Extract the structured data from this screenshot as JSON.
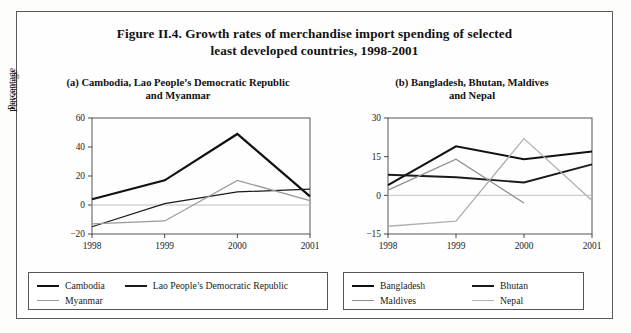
{
  "figure": {
    "title_line1": "Figure II.4.  Growth rates of merchandise import spending of selected",
    "title_line2": "least developed countries, 1998-2001"
  },
  "panel_a": {
    "subtitle_line1": "(a)   Cambodia, Lao People’s Democratic Republic",
    "subtitle_line2": "and Myanmar",
    "legend": [
      {
        "label": "Cambodia",
        "color": "#111111"
      },
      {
        "label": "Lao People’s Democratic Republic",
        "color": "#1a1a1a"
      },
      {
        "label": "Myanmar",
        "color": "#9a9a9a"
      }
    ]
  },
  "panel_b": {
    "subtitle_line1": "(b)   Bangladesh, Bhutan, Maldives",
    "subtitle_line2": "and Nepal",
    "legend": [
      {
        "label": "Bangladesh",
        "color": "#111111"
      },
      {
        "label": "Bhutan",
        "color": "#1a1a1a"
      },
      {
        "label": "Maldives",
        "color": "#8e8e8e"
      },
      {
        "label": "Nepal",
        "color": "#b0b0b0"
      }
    ]
  },
  "chart_data": [
    {
      "id": "chart-a",
      "type": "line",
      "title": "(a)   Cambodia, Lao People’s Democratic Republic and Myanmar",
      "xlabel": "",
      "ylabel": "Percentage",
      "categories": [
        "1998",
        "1999",
        "2000",
        "2001"
      ],
      "x": [
        1998,
        1999,
        2000,
        2001
      ],
      "ylim": [
        -20,
        60
      ],
      "yticks": [
        -20,
        0,
        20,
        40,
        60
      ],
      "ytick_labels": [
        "−20",
        "0",
        "20",
        "40",
        "60"
      ],
      "grid": false,
      "legend_position": "bottom",
      "series": [
        {
          "name": "Cambodia",
          "color": "#111111",
          "width": 2.2,
          "values": [
            4,
            17,
            49,
            6
          ]
        },
        {
          "name": "Lao People’s Democratic Republic",
          "color": "#1a1a1a",
          "width": 1.3,
          "values": [
            -15,
            1,
            9,
            11
          ]
        },
        {
          "name": "Myanmar",
          "color": "#9a9a9a",
          "width": 1.3,
          "values": [
            -13,
            -11,
            17,
            3
          ]
        }
      ]
    },
    {
      "id": "chart-b",
      "type": "line",
      "title": "(b)   Bangladesh, Bhutan, Maldives and Nepal",
      "xlabel": "",
      "ylabel": "Percentage",
      "categories": [
        "1998",
        "1999",
        "2000",
        "2001"
      ],
      "x": [
        1998,
        1999,
        2000,
        2001
      ],
      "ylim": [
        -15,
        30
      ],
      "yticks": [
        -15,
        0,
        15,
        30
      ],
      "ytick_labels": [
        "−15",
        "0",
        "15",
        "30"
      ],
      "grid": false,
      "legend_position": "bottom",
      "series": [
        {
          "name": "Bangladesh",
          "color": "#111111",
          "width": 2.0,
          "values": [
            4,
            19,
            14,
            17
          ]
        },
        {
          "name": "Bhutan",
          "color": "#1a1a1a",
          "width": 1.9,
          "values": [
            8,
            7,
            5,
            12
          ]
        },
        {
          "name": "Maldives",
          "color": "#8e8e8e",
          "width": 1.3,
          "values": [
            2,
            14,
            -3,
            null
          ]
        },
        {
          "name": "Nepal",
          "color": "#b0b0b0",
          "width": 1.3,
          "values": [
            -12,
            -10,
            22,
            -2
          ]
        }
      ]
    }
  ]
}
